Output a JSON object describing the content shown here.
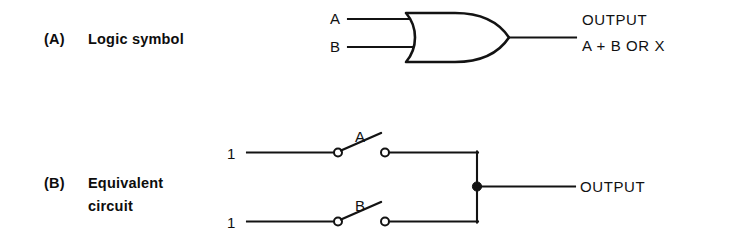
{
  "figure": {
    "width": 734,
    "height": 251,
    "background": "#ffffff",
    "ink_color": "#131313"
  },
  "panel_a": {
    "caption_index": "(A)",
    "caption_text": "Logic symbol",
    "gate_type": "OR gate",
    "inputs": [
      {
        "label": "A"
      },
      {
        "label": "B"
      }
    ],
    "output": {
      "line1": "OUTPUT",
      "line2": "A + B  OR  X"
    }
  },
  "panel_b": {
    "caption_index": "(B)",
    "caption_line1": "Equivalent",
    "caption_line2": "circuit",
    "branches": [
      {
        "source_label": "1",
        "switch_label": "A"
      },
      {
        "source_label": "1",
        "switch_label": "B"
      }
    ],
    "output": {
      "label": "OUTPUT"
    }
  }
}
